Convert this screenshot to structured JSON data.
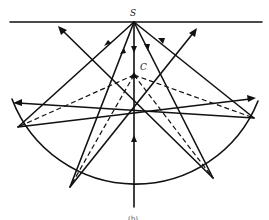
{
  "figure": {
    "labels": {
      "source": "S",
      "center": "C",
      "caption": "(b)"
    },
    "colors": {
      "stroke": "#111111",
      "background": "#ffffff"
    }
  }
}
